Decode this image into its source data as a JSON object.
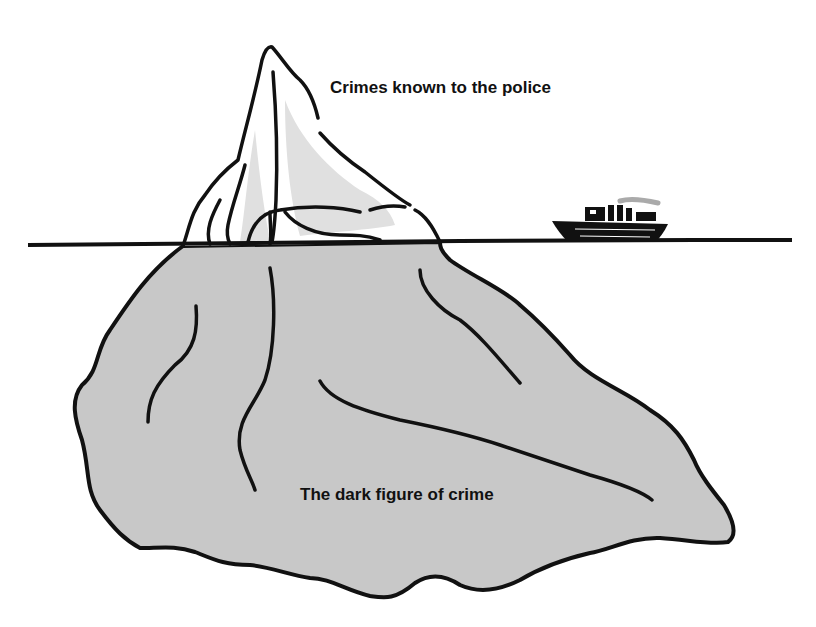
{
  "diagram": {
    "type": "iceberg-metaphor",
    "labels": {
      "top": "Crimes known to the police",
      "bottom": "The dark figure of crime"
    },
    "elements": {
      "tip": "Iceberg tip above waterline",
      "base": "Submerged iceberg mass",
      "waterline": "Horizontal sea level line",
      "ship": "Small ship on the waterline"
    },
    "colors": {
      "outline": "#111111",
      "submerged_fill": "#c8c8c8",
      "tip_shade": "#e0e0e0",
      "background": "#ffffff"
    }
  }
}
